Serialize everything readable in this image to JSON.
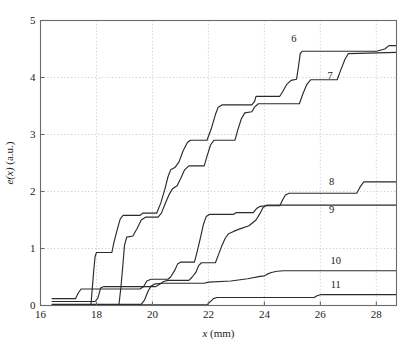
{
  "chart_data": {
    "type": "line",
    "title": "",
    "subtitle": "",
    "xlabel": "x (mm)",
    "ylabel": "e(x) (a.u.)",
    "xlim": [
      16,
      28.72
    ],
    "ylim": [
      0,
      5
    ],
    "xticks": [
      16,
      18,
      20,
      22,
      24,
      26,
      28
    ],
    "yticks": [
      0,
      1,
      2,
      3,
      4,
      5
    ],
    "xtick_labels": [
      "16",
      "18",
      "20",
      "22",
      "24",
      "26",
      "28"
    ],
    "ytick_labels": [
      "0",
      "1",
      "2",
      "3",
      "4",
      "5"
    ],
    "grid": true,
    "grid_style": "dotted",
    "legend": "inline-annotations",
    "line_color": "#2b2b2b",
    "annotations": [
      {
        "text": "6",
        "x": 25.05,
        "y": 4.62
      },
      {
        "text": "7",
        "x": 26.35,
        "y": 3.98
      },
      {
        "text": "8",
        "x": 26.4,
        "y": 2.12
      },
      {
        "text": "9",
        "x": 26.4,
        "y": 1.62
      },
      {
        "text": "10",
        "x": 26.55,
        "y": 0.73
      },
      {
        "text": "11",
        "x": 26.55,
        "y": 0.3
      }
    ],
    "series": [
      {
        "name": "6",
        "label": "6",
        "points": [
          [
            16.4,
            0.0
          ],
          [
            17.8,
            0.0
          ],
          [
            17.85,
            0.3
          ],
          [
            17.9,
            0.6
          ],
          [
            17.95,
            0.86
          ],
          [
            18.0,
            0.93
          ],
          [
            18.55,
            0.93
          ],
          [
            18.62,
            1.1
          ],
          [
            18.75,
            1.35
          ],
          [
            18.85,
            1.52
          ],
          [
            18.95,
            1.58
          ],
          [
            19.55,
            1.58
          ],
          [
            19.65,
            1.62
          ],
          [
            20.15,
            1.62
          ],
          [
            20.3,
            1.8
          ],
          [
            20.45,
            2.05
          ],
          [
            20.55,
            2.25
          ],
          [
            20.65,
            2.38
          ],
          [
            20.8,
            2.42
          ],
          [
            20.95,
            2.52
          ],
          [
            21.1,
            2.72
          ],
          [
            21.25,
            2.86
          ],
          [
            21.35,
            2.9
          ],
          [
            21.95,
            2.9
          ],
          [
            22.1,
            3.1
          ],
          [
            22.25,
            3.35
          ],
          [
            22.35,
            3.48
          ],
          [
            22.5,
            3.52
          ],
          [
            23.55,
            3.52
          ],
          [
            23.65,
            3.58
          ],
          [
            23.7,
            3.67
          ],
          [
            24.55,
            3.67
          ],
          [
            24.65,
            3.75
          ],
          [
            24.8,
            3.88
          ],
          [
            24.95,
            3.95
          ],
          [
            25.15,
            3.97
          ],
          [
            25.22,
            4.2
          ],
          [
            25.28,
            4.42
          ],
          [
            25.35,
            4.46
          ],
          [
            28.0,
            4.46
          ],
          [
            28.3,
            4.5
          ],
          [
            28.45,
            4.56
          ],
          [
            28.72,
            4.56
          ]
        ]
      },
      {
        "name": "7",
        "label": "7",
        "points": [
          [
            16.4,
            0.0
          ],
          [
            18.8,
            0.0
          ],
          [
            18.88,
            0.35
          ],
          [
            18.95,
            0.75
          ],
          [
            19.0,
            1.05
          ],
          [
            19.08,
            1.2
          ],
          [
            19.3,
            1.22
          ],
          [
            19.45,
            1.35
          ],
          [
            19.6,
            1.5
          ],
          [
            19.75,
            1.55
          ],
          [
            20.2,
            1.55
          ],
          [
            20.32,
            1.62
          ],
          [
            20.45,
            1.78
          ],
          [
            20.6,
            1.95
          ],
          [
            20.72,
            2.05
          ],
          [
            20.88,
            2.1
          ],
          [
            21.0,
            2.22
          ],
          [
            21.15,
            2.38
          ],
          [
            21.3,
            2.45
          ],
          [
            21.85,
            2.45
          ],
          [
            21.95,
            2.62
          ],
          [
            22.08,
            2.82
          ],
          [
            22.2,
            2.9
          ],
          [
            22.95,
            2.9
          ],
          [
            23.05,
            3.08
          ],
          [
            23.18,
            3.28
          ],
          [
            23.3,
            3.38
          ],
          [
            23.55,
            3.4
          ],
          [
            23.65,
            3.48
          ],
          [
            23.78,
            3.54
          ],
          [
            25.25,
            3.54
          ],
          [
            25.38,
            3.72
          ],
          [
            25.52,
            3.88
          ],
          [
            25.65,
            3.96
          ],
          [
            26.6,
            3.96
          ],
          [
            26.72,
            4.12
          ],
          [
            26.88,
            4.32
          ],
          [
            27.0,
            4.42
          ],
          [
            28.72,
            4.44
          ]
        ]
      },
      {
        "name": "8",
        "label": "8",
        "points": [
          [
            16.4,
            0.12
          ],
          [
            17.25,
            0.12
          ],
          [
            17.35,
            0.22
          ],
          [
            17.45,
            0.29
          ],
          [
            19.55,
            0.29
          ],
          [
            19.68,
            0.33
          ],
          [
            19.8,
            0.43
          ],
          [
            19.95,
            0.46
          ],
          [
            20.55,
            0.46
          ],
          [
            20.65,
            0.5
          ],
          [
            20.8,
            0.62
          ],
          [
            20.9,
            0.73
          ],
          [
            21.0,
            0.76
          ],
          [
            21.5,
            0.76
          ],
          [
            21.6,
            0.95
          ],
          [
            21.72,
            1.2
          ],
          [
            21.82,
            1.42
          ],
          [
            21.92,
            1.56
          ],
          [
            22.05,
            1.6
          ],
          [
            22.9,
            1.6
          ],
          [
            23.0,
            1.63
          ],
          [
            23.6,
            1.63
          ],
          [
            23.72,
            1.7
          ],
          [
            23.85,
            1.74
          ],
          [
            24.05,
            1.75
          ],
          [
            24.55,
            1.75
          ],
          [
            24.65,
            1.85
          ],
          [
            24.75,
            1.94
          ],
          [
            24.88,
            1.97
          ],
          [
            27.3,
            1.97
          ],
          [
            27.42,
            2.08
          ],
          [
            27.55,
            2.17
          ],
          [
            28.72,
            2.17
          ]
        ]
      },
      {
        "name": "9",
        "label": "9",
        "points": [
          [
            16.4,
            0.07
          ],
          [
            17.95,
            0.07
          ],
          [
            18.05,
            0.13
          ],
          [
            18.15,
            0.31
          ],
          [
            18.25,
            0.33
          ],
          [
            20.1,
            0.33
          ],
          [
            20.25,
            0.37
          ],
          [
            20.4,
            0.42
          ],
          [
            20.55,
            0.44
          ],
          [
            21.3,
            0.44
          ],
          [
            21.42,
            0.5
          ],
          [
            21.55,
            0.58
          ],
          [
            21.65,
            0.7
          ],
          [
            21.75,
            0.75
          ],
          [
            22.25,
            0.75
          ],
          [
            22.35,
            0.88
          ],
          [
            22.48,
            1.05
          ],
          [
            22.6,
            1.18
          ],
          [
            22.72,
            1.26
          ],
          [
            22.9,
            1.3
          ],
          [
            23.1,
            1.34
          ],
          [
            23.45,
            1.4
          ],
          [
            23.7,
            1.5
          ],
          [
            23.85,
            1.62
          ],
          [
            23.95,
            1.72
          ],
          [
            24.08,
            1.76
          ],
          [
            28.72,
            1.76
          ]
        ]
      },
      {
        "name": "10",
        "label": "10",
        "points": [
          [
            16.4,
            0.02
          ],
          [
            19.6,
            0.02
          ],
          [
            19.72,
            0.1
          ],
          [
            19.85,
            0.26
          ],
          [
            19.95,
            0.34
          ],
          [
            20.1,
            0.38
          ],
          [
            20.35,
            0.39
          ],
          [
            21.85,
            0.39
          ],
          [
            22.0,
            0.41
          ],
          [
            22.8,
            0.43
          ],
          [
            23.4,
            0.47
          ],
          [
            23.85,
            0.51
          ],
          [
            24.0,
            0.52
          ],
          [
            24.1,
            0.55
          ],
          [
            24.25,
            0.58
          ],
          [
            24.45,
            0.6
          ],
          [
            24.7,
            0.61
          ],
          [
            28.72,
            0.61
          ]
        ]
      },
      {
        "name": "11",
        "label": "11",
        "points": [
          [
            16.4,
            0.01
          ],
          [
            21.95,
            0.01
          ],
          [
            22.05,
            0.06
          ],
          [
            22.18,
            0.12
          ],
          [
            22.3,
            0.14
          ],
          [
            25.78,
            0.14
          ],
          [
            25.88,
            0.17
          ],
          [
            26.0,
            0.19
          ],
          [
            28.72,
            0.19
          ]
        ]
      }
    ]
  }
}
